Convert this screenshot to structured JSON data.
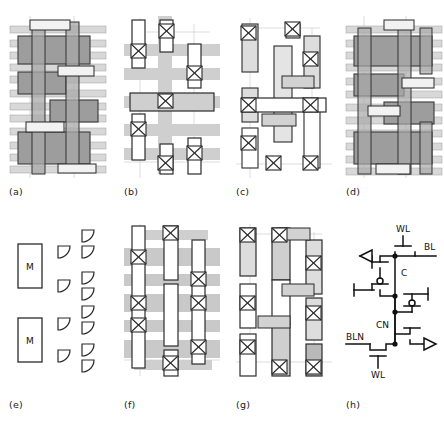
{
  "figure": {
    "type": "multi-panel-technical-figure",
    "background": "#ffffff",
    "panel_count": 8
  },
  "captions": {
    "a": "(a)",
    "b": "(b)",
    "c": "(c)",
    "d": "(d)",
    "e": "(e)",
    "f": "(f)",
    "g": "(g)",
    "h": "(h)"
  },
  "palette": {
    "ink": "#1a1a1a",
    "outline": "#2b2b2b",
    "light_gray": "#d6d6d6",
    "pale_gray": "#e2e2e2",
    "mid_gray": "#b9b9b9",
    "dark_gray": "#9a9a9a",
    "hatch_dark": "#8c8c8c",
    "white": "#ffffff",
    "guide": "#bcbcbc"
  },
  "legend_panel_e": {
    "module_label": "M",
    "module_count": 2,
    "quarter_shape_count": 12,
    "note": "Two labelled modules with quarter-round terminal glyphs arranged in two columns."
  },
  "schematic_h": {
    "title": "six-transistor memory cell schematic",
    "nodes": [
      {
        "id": "wl-top",
        "label": "WL",
        "x": 392,
        "y": 238
      },
      {
        "id": "bl",
        "label": "BL",
        "x": 421,
        "y": 258
      },
      {
        "id": "c",
        "label": "C",
        "x": 390,
        "y": 283
      },
      {
        "id": "cn",
        "label": "CN",
        "x": 379,
        "y": 338
      },
      {
        "id": "bln",
        "label": "BLN",
        "x": 350,
        "y": 350
      },
      {
        "id": "wl-bot",
        "label": "WL",
        "x": 375,
        "y": 385
      }
    ],
    "transistor_count": 6,
    "junction_dots": 4,
    "output_arrows": 2
  },
  "layout_panels": {
    "a": {
      "id": "a",
      "style": "dense-hatched-stack",
      "rows": 12,
      "vertical_tracks": 2
    },
    "b": {
      "id": "b",
      "style": "gray-bars-with-vias",
      "rows": 5,
      "vertical_tracks": 1,
      "via_count": 9
    },
    "c": {
      "id": "c",
      "style": "vertical-cells-with-vias",
      "via_count": 8
    },
    "d": {
      "id": "d",
      "style": "dense-hatched-stack",
      "rows": 12,
      "vertical_tracks": 2
    },
    "f": {
      "id": "f",
      "style": "gray-bars-with-vias",
      "rows": 6,
      "vertical_tracks": 3,
      "via_count": 11
    },
    "g": {
      "id": "g",
      "style": "vertical-cells-with-vias",
      "via_count": 10
    }
  }
}
